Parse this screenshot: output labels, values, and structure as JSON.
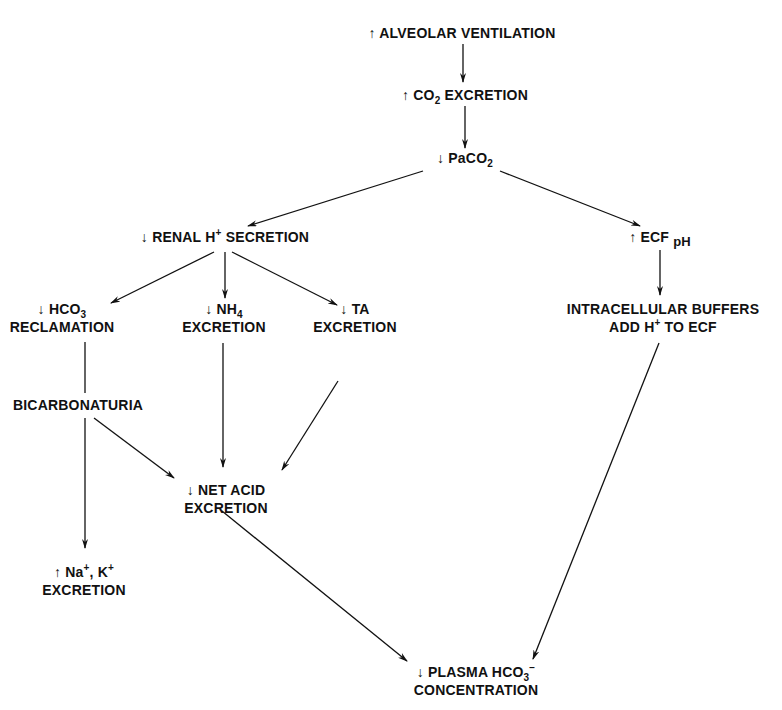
{
  "diagram": {
    "type": "flowchart",
    "nodes": [
      {
        "id": "alveolar",
        "arrow": "↑",
        "line1": "ALVEOLAR VENTILATION",
        "line2": ""
      },
      {
        "id": "co2",
        "arrow": "↑",
        "pre": "CO",
        "sub": "2",
        "post": " EXCRETION"
      },
      {
        "id": "paco2",
        "arrow": "↓",
        "pre": "PaCO",
        "sub": "2"
      },
      {
        "id": "renal",
        "arrow": "↓",
        "pre": "RENAL H",
        "sup": "+",
        "post": " SECRETION"
      },
      {
        "id": "ecf",
        "arrow": "↑",
        "pre": "ECF ",
        "sub": "pH"
      },
      {
        "id": "hco3",
        "arrow": "↓",
        "pre": "HCO",
        "sub": "3",
        "line2": "RECLAMATION"
      },
      {
        "id": "nh4",
        "arrow": "↓",
        "pre": "NH",
        "sub": "4",
        "line2": "EXCRETION"
      },
      {
        "id": "ta",
        "arrow": "↓",
        "pre": "TA",
        "line2": "EXCRETION"
      },
      {
        "id": "buffers",
        "line1": "INTRACELLULAR BUFFERS",
        "pre": "ADD H",
        "sup": "+",
        "post": " TO ECF"
      },
      {
        "id": "bicarb",
        "line1": "BICARBONATURIA"
      },
      {
        "id": "netacid",
        "arrow": "↓",
        "line1": "NET ACID",
        "line2": "EXCRETION"
      },
      {
        "id": "nak",
        "arrow": "↑",
        "pre": "Na",
        "sup": "+",
        "mid": ", K",
        "sup2": "+",
        "line2": "EXCRETION"
      },
      {
        "id": "plasma",
        "arrow": "↓",
        "pre": "PLASMA HCO",
        "sub": "3",
        "sup": "−",
        "line2": "CONCENTRATION"
      }
    ],
    "edges": [
      {
        "from": "alveolar",
        "to": "co2"
      },
      {
        "from": "co2",
        "to": "paco2"
      },
      {
        "from": "paco2",
        "to": "renal"
      },
      {
        "from": "paco2",
        "to": "ecf"
      },
      {
        "from": "renal",
        "to": "hco3"
      },
      {
        "from": "renal",
        "to": "nh4"
      },
      {
        "from": "renal",
        "to": "ta"
      },
      {
        "from": "ecf",
        "to": "buffers"
      },
      {
        "from": "hco3",
        "to": "bicarb"
      },
      {
        "from": "bicarb",
        "to": "nak"
      },
      {
        "from": "bicarb",
        "to": "netacid"
      },
      {
        "from": "nh4",
        "to": "netacid"
      },
      {
        "from": "ta",
        "to": "netacid"
      },
      {
        "from": "netacid",
        "to": "plasma"
      },
      {
        "from": "buffers",
        "to": "plasma"
      }
    ],
    "colors": {
      "ink": "#111111",
      "background": "#ffffff"
    }
  }
}
